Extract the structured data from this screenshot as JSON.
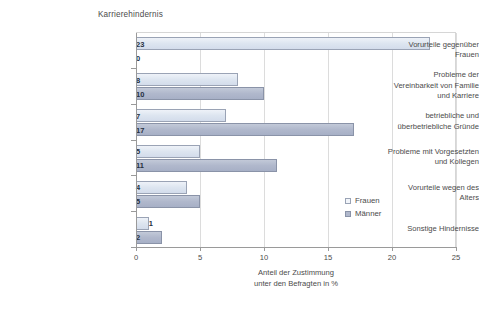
{
  "chart_data": {
    "type": "bar",
    "orientation": "horizontal",
    "title": "Karrierehindernis",
    "xlabel": "Anteil der Zustimmung unter den Befragten in %",
    "xlabel_lines": [
      "Anteil der Zustimmung",
      "unter den Befragten in %"
    ],
    "ylabel": "",
    "xlim": [
      0,
      25
    ],
    "xticks": [
      0,
      5,
      10,
      15,
      20,
      25
    ],
    "xticklabels": [
      "0",
      "5",
      "10",
      "15",
      "20",
      "25"
    ],
    "grid": true,
    "grid_axis": "x",
    "legend_position": "inside-right",
    "categories": [
      "Vorurteile gegenüber Frauen",
      "Probleme der Vereinbarkeit von Familie und Karriere",
      "betriebliche und überbetriebliche Gründe",
      "Probleme mit Vorgesetzten und Kollegen",
      "Vorurteile wegen des Alters",
      "Sonstige Hindernisse"
    ],
    "category_lines": [
      [
        "Vorurteile gegenüber",
        "Frauen"
      ],
      [
        "Probleme der",
        "Vereinbarkeit von Familie",
        "und Karriere"
      ],
      [
        "betriebliche und",
        "überbetriebliche Gründe"
      ],
      [
        "Probleme mit Vorgesetzten",
        "und Kollegen"
      ],
      [
        "Vorurteile wegen des",
        "Alters"
      ],
      [
        "Sonstige Hindernisse"
      ]
    ],
    "series": [
      {
        "name": "Frauen",
        "color": "#dde5f0",
        "edge_color": "#9aa3b5",
        "values": [
          23,
          8,
          7,
          5,
          4,
          1
        ]
      },
      {
        "name": "Männer",
        "color": "#b0b8cc",
        "edge_color": "#8a93a8",
        "values": [
          0,
          10,
          17,
          11,
          5,
          2
        ]
      }
    ]
  },
  "legend": {
    "items": [
      {
        "label": "Frauen"
      },
      {
        "label": "Männer"
      }
    ]
  },
  "colors": {
    "frauen": "#dde5f0",
    "maenner": "#b0b8cc",
    "grid": "#dcdcdc",
    "axis": "#9a9a9a",
    "text": "#4b4b4b",
    "label_text": "#27303f"
  }
}
